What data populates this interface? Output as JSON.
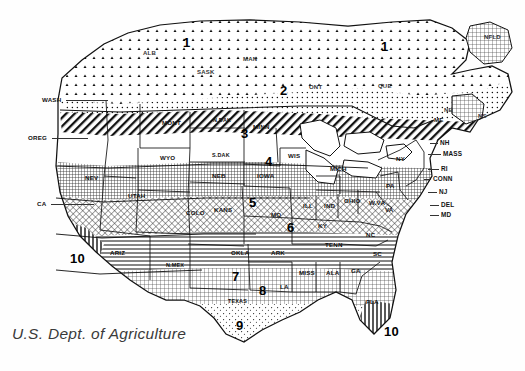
{
  "map": {
    "title": "USDA Plant Hardiness Zone Map",
    "caption": "U.S. Dept. of Agriculture",
    "source": "U.S. Dept. of Agriculture"
  },
  "chart_data": {
    "type": "map",
    "legend_position": "none",
    "zone_labels": [
      "1",
      "2",
      "3",
      "4",
      "5",
      "6",
      "7",
      "8",
      "9",
      "10"
    ],
    "zones": [
      {
        "zone": "1",
        "x": 183,
        "y": 36
      },
      {
        "zone": "1",
        "x": 381,
        "y": 40
      },
      {
        "zone": "2",
        "x": 280,
        "y": 84
      },
      {
        "zone": "3",
        "x": 241,
        "y": 127
      },
      {
        "zone": "4",
        "x": 265,
        "y": 155
      },
      {
        "zone": "5",
        "x": 249,
        "y": 196
      },
      {
        "zone": "6",
        "x": 287,
        "y": 221
      },
      {
        "zone": "7",
        "x": 232,
        "y": 270
      },
      {
        "zone": "8",
        "x": 259,
        "y": 284
      },
      {
        "zone": "9",
        "x": 236,
        "y": 319
      },
      {
        "zone": "10",
        "x": 70,
        "y": 252
      },
      {
        "zone": "10",
        "x": 384,
        "y": 325
      }
    ],
    "states": [
      {
        "label": "WASH",
        "x": 42,
        "y": 97,
        "leader": {
          "x1": 66,
          "y1": 100,
          "x2": 108,
          "y2": 100
        }
      },
      {
        "label": "OREG",
        "x": 28,
        "y": 135,
        "leader": {
          "x1": 52,
          "y1": 138,
          "x2": 88,
          "y2": 138
        }
      },
      {
        "label": "CA",
        "x": 37,
        "y": 201,
        "leader": {
          "x1": 51,
          "y1": 204,
          "x2": 94,
          "y2": 204
        }
      },
      {
        "label": "NEV",
        "x": 85,
        "y": 175
      },
      {
        "label": "UTAH",
        "x": 128,
        "y": 193
      },
      {
        "label": "ARIZ",
        "x": 110,
        "y": 250
      },
      {
        "label": "N.MEX",
        "x": 166,
        "y": 263
      },
      {
        "label": "COLO",
        "x": 186,
        "y": 210
      },
      {
        "label": "MONT",
        "x": 162,
        "y": 120
      },
      {
        "label": "WYO",
        "x": 160,
        "y": 155
      },
      {
        "label": "N.DAK",
        "x": 213,
        "y": 118
      },
      {
        "label": "S.DAK",
        "x": 212,
        "y": 153
      },
      {
        "label": "NEB",
        "x": 212,
        "y": 173
      },
      {
        "label": "KANS",
        "x": 214,
        "y": 207
      },
      {
        "label": "OKLA",
        "x": 231,
        "y": 250
      },
      {
        "label": "TEXAS",
        "x": 228,
        "y": 299
      },
      {
        "label": "MINN",
        "x": 253,
        "y": 124
      },
      {
        "label": "IOWA",
        "x": 257,
        "y": 173
      },
      {
        "label": "MO",
        "x": 271,
        "y": 212
      },
      {
        "label": "ARK",
        "x": 271,
        "y": 250
      },
      {
        "label": "LA",
        "x": 280,
        "y": 284
      },
      {
        "label": "WIS",
        "x": 288,
        "y": 153
      },
      {
        "label": "ILL",
        "x": 303,
        "y": 203
      },
      {
        "label": "MISS",
        "x": 299,
        "y": 270
      },
      {
        "label": "MICH",
        "x": 330,
        "y": 166
      },
      {
        "label": "IND",
        "x": 324,
        "y": 203
      },
      {
        "label": "OHIO",
        "x": 344,
        "y": 198
      },
      {
        "label": "KY",
        "x": 318,
        "y": 223
      },
      {
        "label": "TENN",
        "x": 325,
        "y": 242
      },
      {
        "label": "ALA",
        "x": 326,
        "y": 270
      },
      {
        "label": "GA",
        "x": 351,
        "y": 268
      },
      {
        "label": "FLA",
        "x": 366,
        "y": 299
      },
      {
        "label": "SC",
        "x": 373,
        "y": 251
      },
      {
        "label": "NC",
        "x": 366,
        "y": 232
      },
      {
        "label": "W.VA",
        "x": 369,
        "y": 200
      },
      {
        "label": "VA",
        "x": 385,
        "y": 207
      },
      {
        "label": "PA",
        "x": 386,
        "y": 183
      },
      {
        "label": "NY",
        "x": 396,
        "y": 156
      },
      {
        "label": "ME",
        "x": 434,
        "y": 117
      }
    ],
    "edge_states": [
      {
        "label": "NH",
        "x": 440,
        "y": 140,
        "leader": {
          "x1": 430,
          "y1": 143,
          "x2": 438,
          "y2": 143
        }
      },
      {
        "label": "MASS",
        "x": 443,
        "y": 151,
        "leader": {
          "x1": 428,
          "y1": 154,
          "x2": 441,
          "y2": 154
        }
      },
      {
        "label": "RI",
        "x": 441,
        "y": 166,
        "leader": {
          "x1": 428,
          "y1": 169,
          "x2": 439,
          "y2": 169
        }
      },
      {
        "label": "CONN",
        "x": 433,
        "y": 176,
        "leader": {
          "x1": 424,
          "y1": 179,
          "x2": 431,
          "y2": 179
        }
      },
      {
        "label": "NJ",
        "x": 439,
        "y": 189,
        "leader": {
          "x1": 428,
          "y1": 192,
          "x2": 437,
          "y2": 192
        }
      },
      {
        "label": "DEL",
        "x": 441,
        "y": 202,
        "leader": {
          "x1": 430,
          "y1": 205,
          "x2": 439,
          "y2": 205
        }
      },
      {
        "label": "MD",
        "x": 441,
        "y": 212,
        "leader": {
          "x1": 430,
          "y1": 215,
          "x2": 439,
          "y2": 215
        }
      }
    ],
    "provinces": [
      {
        "label": "ALB",
        "x": 143,
        "y": 50
      },
      {
        "label": "SASK",
        "x": 197,
        "y": 69
      },
      {
        "label": "MAN",
        "x": 243,
        "y": 56
      },
      {
        "label": "ONT",
        "x": 309,
        "y": 84
      },
      {
        "label": "QUE",
        "x": 378,
        "y": 83
      },
      {
        "label": "NB",
        "x": 444,
        "y": 107
      },
      {
        "label": "NS",
        "x": 478,
        "y": 113
      },
      {
        "label": "NFLD",
        "x": 484,
        "y": 34
      }
    ]
  }
}
